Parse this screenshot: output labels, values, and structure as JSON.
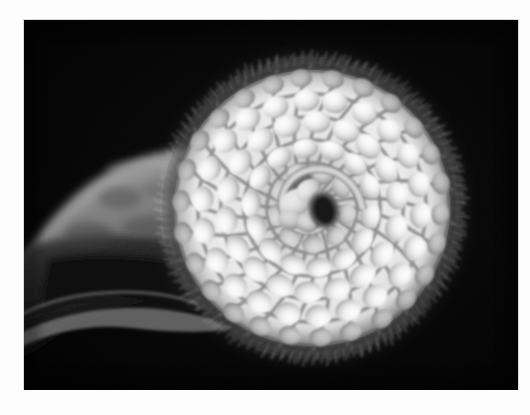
{
  "image": {
    "title": "Coiled chameleon tail",
    "subject": "chameleon-tail-spiral",
    "medium": "black and white photograph",
    "orientation": "landscape",
    "background_color": "#050505",
    "page_background_color": "#fdfdfd",
    "border_color": "#d8d8d8",
    "plate": {
      "x": 24,
      "y": 20,
      "width": 494,
      "height": 370
    },
    "alt_text": "Grayscale macro photograph of a chameleon's prehensile tail curled into a tight logarithmic spiral against a black background. The tail base enters from the upper left and tapers into the coil. Rows of pale, rounded scales radiate outward from a dark center, and fine bristle-like spines fringe the outer rim."
  },
  "scene": {
    "background_label": "black-backdrop",
    "elements": [
      {
        "name": "tail-base",
        "label": "Tapering tail base entering from upper left",
        "tone": "mid-gray"
      },
      {
        "name": "tail-base-shadow",
        "label": "Shadowed underside of tail base",
        "tone": "near-black"
      },
      {
        "name": "coil",
        "label": "Spiral coil of the tail",
        "tone": "bright white"
      },
      {
        "name": "coil-center",
        "label": "Dark center of the spiral where the tail tip curls in",
        "tone": "black"
      },
      {
        "name": "bristle-fringe",
        "label": "Spiny bristle fringe around the outer rim",
        "tone": "light gray"
      },
      {
        "name": "scale-rows",
        "label": "Radiating rows of rounded scales",
        "tone": "white highlights with gray seams"
      }
    ]
  },
  "geometry": {
    "coil_center": {
      "x": 288,
      "y": 188
    },
    "coil_outer_radius": 148,
    "coil_inner_radius": 16,
    "spiral_turns": 2.1,
    "scale_row_count": 26,
    "scale_ring_count": 5,
    "bristle_count": 320
  },
  "palette": {
    "backdrop": "#050505",
    "scale_highlight": "#f7f7f7",
    "scale_midtone": "#cfcfcf",
    "seam_shadow": "#6e6e6e",
    "tail_base": "#8a8a8a",
    "tail_base_dark": "#1b1b1b",
    "bristle": "#b4b4b4",
    "center_dark": "#0a0a0a"
  }
}
